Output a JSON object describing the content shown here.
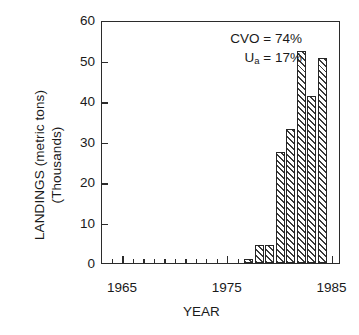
{
  "chart_data": {
    "type": "bar",
    "title": "",
    "xlabel": "YEAR",
    "ylabel_line1": "LANDINGS (metric tons)",
    "ylabel_line2": "(Thousands)",
    "xlim": [
      1963,
      1985.8
    ],
    "ylim": [
      0,
      60
    ],
    "grid": false,
    "legend": "none",
    "xticks": [
      1965,
      1975,
      1985
    ],
    "xtick_labels": [
      "1965",
      "1975",
      "1985"
    ],
    "yticks": [
      0,
      10,
      20,
      30,
      40,
      50,
      60
    ],
    "ytick_labels": [
      "0",
      "10",
      "20",
      "30",
      "40",
      "50",
      "60"
    ],
    "x": [
      1977,
      1978,
      1979,
      1980,
      1981,
      1982,
      1983,
      1984
    ],
    "categories": [
      "1977",
      "1978",
      "1979",
      "1980",
      "1981",
      "1982",
      "1983",
      "1984"
    ],
    "values": [
      1.1,
      4.4,
      4.4,
      27.3,
      33.2,
      52.3,
      41.3,
      50.7
    ],
    "bar_width_years": 0.86,
    "annotations": [
      {
        "label": "CVO",
        "value": "74%",
        "text": "CVO = 74%"
      },
      {
        "label": "U",
        "sub": "a",
        "value": "17%",
        "text": "Ua = 17%"
      }
    ]
  },
  "annotation": {
    "line1": "CVO = 74%",
    "line2_prefix": "U",
    "line2_sub": "a",
    "line2_suffix": " = 17%"
  },
  "colors": {
    "axis": "#2b2b2b",
    "bar_hatch": "#3a3a3a",
    "bar_fill": "#ffffff",
    "text": "#1a1a1a",
    "background": "#ffffff"
  }
}
